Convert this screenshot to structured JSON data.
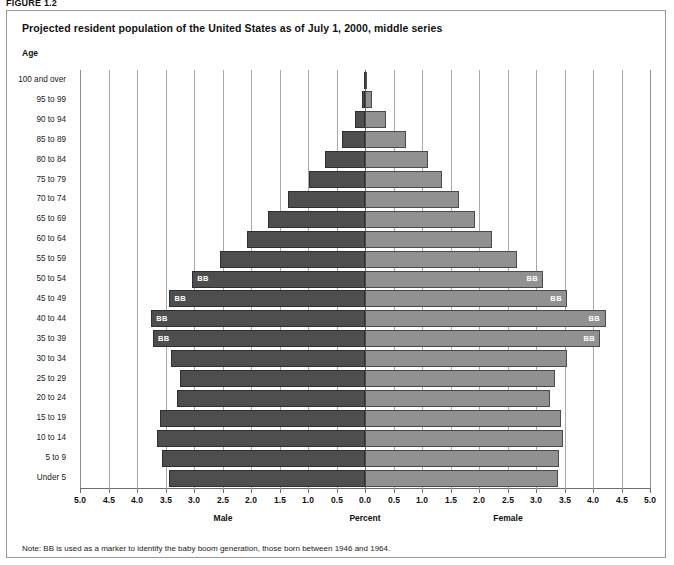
{
  "figure_label": "FIGURE 1.2",
  "chart_title": "Projected resident population of the United States as of July 1, 2000, middle series",
  "age_header": "Age",
  "note": "Note: BB is used as a marker to identify the baby boom generation, those born between 1946 and 1964.",
  "captions": {
    "male": "Male",
    "percent": "Percent",
    "female": "Female"
  },
  "colors": {
    "male_bar": "#4e4e4e",
    "female_bar": "#919191",
    "bar_outline": "#2f2f2f",
    "gridline": "#a8a8a8",
    "center_line": "#6e6e6e",
    "frame": "#9a9a9a",
    "bb_label": "#ffffff"
  },
  "bb_marker_text": "BB",
  "chart_data": {
    "type": "bar",
    "subtype": "population-pyramid",
    "title": "Projected resident population of the United States as of July 1, 2000, middle series",
    "xlabel": "Percent",
    "ylabel": "Age",
    "xlim": [
      -5.0,
      5.0
    ],
    "axis_display_absolute": true,
    "xticks": [
      5.0,
      4.5,
      4.0,
      3.5,
      3.0,
      2.5,
      2.0,
      1.5,
      1.0,
      0.5,
      0.0,
      0.5,
      1.0,
      1.5,
      2.0,
      2.5,
      3.0,
      3.5,
      4.0,
      4.5,
      5.0
    ],
    "xtick_labels": [
      "5.0",
      "4.5",
      "4.0",
      "3.5",
      "3.0",
      "2.5",
      "2.0",
      "1.5",
      "1.0",
      "0.5",
      "0.0",
      "0.5",
      "1.0",
      "1.5",
      "2.0",
      "2.5",
      "3.0",
      "3.5",
      "4.0",
      "4.5",
      "5.0"
    ],
    "grid": true,
    "legend": [
      "Male",
      "Female"
    ],
    "legend_position": "below-axis",
    "categories": [
      "100 and over",
      "95 to 99",
      "90 to 94",
      "85 to 89",
      "80 to 84",
      "75 to 79",
      "70 to 74",
      "65 to 69",
      "60 to 64",
      "55 to 59",
      "50 to 54",
      "45 to 49",
      "40 to 44",
      "35 to 39",
      "30 to 34",
      "25 to 29",
      "20 to 24",
      "15 to 19",
      "10 to 14",
      "5 to 9",
      "Under 5"
    ],
    "series": [
      {
        "name": "Male",
        "side": "left",
        "values": [
          0.01,
          0.05,
          0.18,
          0.41,
          0.71,
          0.99,
          1.35,
          1.7,
          2.07,
          2.55,
          3.03,
          3.43,
          3.75,
          3.72,
          3.4,
          3.25,
          3.3,
          3.6,
          3.65,
          3.57,
          3.43
        ]
      },
      {
        "name": "Female",
        "side": "right",
        "values": [
          0.03,
          0.12,
          0.36,
          0.72,
          1.1,
          1.35,
          1.65,
          1.93,
          2.22,
          2.67,
          3.13,
          3.55,
          4.22,
          4.13,
          3.55,
          3.33,
          3.25,
          3.43,
          3.47,
          3.4,
          3.38
        ]
      }
    ],
    "bb_markers": {
      "label": "BB",
      "categories": [
        "50 to 54",
        "45 to 49",
        "40 to 44",
        "35 to 39"
      ],
      "description": "Baby boom generation marker shown on both male and female bars"
    }
  }
}
